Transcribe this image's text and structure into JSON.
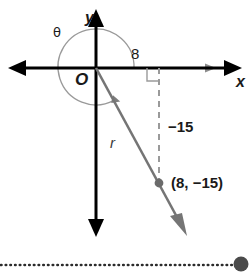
{
  "figure": {
    "type": "coordinate-plane-diagram",
    "colors": {
      "axis": "#000000",
      "ray": "#6e6e6e",
      "arc": "#8a8a8a",
      "dashed": "#8a8a8a",
      "text": "#1a1a1a",
      "background": "#ffffff",
      "dotted_rule": "#2b2b2b"
    },
    "labels": {
      "y_axis": "y",
      "x_axis": "x",
      "origin": "O",
      "theta": "θ",
      "radius": "r",
      "x_leg": "8",
      "y_leg": "−15",
      "point": "(8, −15)"
    },
    "geometry": {
      "origin": {
        "x": 96,
        "y": 68
      },
      "point": {
        "x": 159,
        "y": 183
      },
      "x_value": 8,
      "y_value": -15,
      "r_value": 17,
      "arc_radius": 38,
      "arc_start_deg": 0,
      "arc_end_deg": 298
    },
    "elements": {
      "right_angle_marker": "right-angle-square",
      "point_marker": "filled-circle",
      "dashed_segment": "vertical-dashed-line",
      "ray_arrow": "gray-arrowhead",
      "arc_arrow": "gray-arrowhead"
    }
  },
  "footer": {
    "rule_style": "dotted",
    "end_marker": "filled-circle"
  }
}
